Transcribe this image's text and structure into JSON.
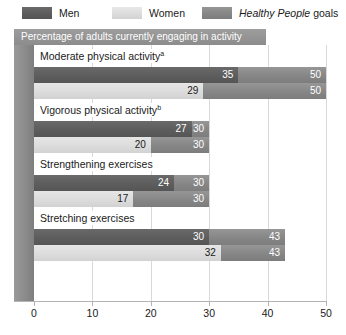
{
  "legend": {
    "entries": [
      {
        "label": "Men",
        "key": "men",
        "color": "#5d5d5d",
        "italic_prefix": ""
      },
      {
        "label": "Women",
        "key": "women",
        "color": "#dcdcdc",
        "italic_prefix": ""
      },
      {
        "label": "goals",
        "key": "goal",
        "color": "#868686",
        "italic_prefix": "Healthy People"
      }
    ]
  },
  "subtitle": "Percentage of adults currently engaging in activity",
  "axis": {
    "ticks": [
      0,
      10,
      20,
      30,
      40,
      50
    ],
    "tick_labels": [
      "0",
      "10",
      "20",
      "30",
      "40",
      "50"
    ]
  },
  "chart_data": {
    "type": "bar",
    "orientation": "horizontal",
    "title": "Percentage of adults currently engaging in activity",
    "xlabel": "",
    "ylabel": "",
    "xlim": [
      0,
      50
    ],
    "grid": true,
    "legend_position": "top",
    "categories": [
      "Moderate physical activity",
      "Vigorous physical activity",
      "Strengthening exercises",
      "Stretching exercises"
    ],
    "category_footnotes": [
      "a",
      "b",
      "",
      ""
    ],
    "series": [
      {
        "name": "Men",
        "values": [
          35,
          27,
          24,
          30
        ]
      },
      {
        "name": "Women",
        "values": [
          29,
          20,
          17,
          32
        ]
      },
      {
        "name": "Healthy People goals",
        "values": [
          50,
          30,
          30,
          43
        ]
      }
    ],
    "groups": [
      {
        "label": "Moderate physical activity",
        "footnote": "a",
        "rows": [
          {
            "series": "Men",
            "value": 35,
            "value_label": "35",
            "goal": 50,
            "goal_label": "50"
          },
          {
            "series": "Women",
            "value": 29,
            "value_label": "29",
            "goal": 50,
            "goal_label": "50"
          }
        ]
      },
      {
        "label": "Vigorous physical activity",
        "footnote": "b",
        "rows": [
          {
            "series": "Men",
            "value": 27,
            "value_label": "27",
            "goal": 30,
            "goal_label": "30"
          },
          {
            "series": "Women",
            "value": 20,
            "value_label": "20",
            "goal": 30,
            "goal_label": "30"
          }
        ]
      },
      {
        "label": "Strengthening exercises",
        "footnote": "",
        "rows": [
          {
            "series": "Men",
            "value": 24,
            "value_label": "24",
            "goal": 30,
            "goal_label": "30"
          },
          {
            "series": "Women",
            "value": 17,
            "value_label": "17",
            "goal": 30,
            "goal_label": "30"
          }
        ]
      },
      {
        "label": "Stretching exercises",
        "footnote": "",
        "rows": [
          {
            "series": "Men",
            "value": 30,
            "value_label": "30",
            "goal": 43,
            "goal_label": "43"
          },
          {
            "series": "Women",
            "value": 32,
            "value_label": "32",
            "goal": 43,
            "goal_label": "43"
          }
        ]
      }
    ]
  },
  "colors": {
    "men": "#5d5d5d",
    "women": "#dcdcdc",
    "goal": "#868686",
    "band": "#8e8e8e",
    "grid": "#d8d8d8"
  }
}
